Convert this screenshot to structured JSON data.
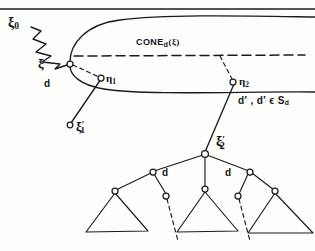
{
  "figure": {
    "ink_color": "#1a1b20",
    "paper_color": "#fdfdfc"
  },
  "labels": {
    "xi0": "ξ",
    "xi0_sub": "0",
    "xi": "ξ",
    "cone_word": "CONE",
    "cone_sub": "d",
    "cone_arg": "(ξ)",
    "d_left": "d",
    "eta1": "η",
    "eta1_sub": "1",
    "eta2": "η",
    "eta2_sub": "2",
    "xi_prime_1": "ξ",
    "xi_prime_1_sup": "′",
    "xi_prime_1_sub": "1",
    "xi_prime_2": "ξ",
    "xi_prime_2_sup": "′",
    "xi_prime_2_sub": "2",
    "d_set_condition": "d′ , d′ ϵ S",
    "d_set_condition_sub": "d",
    "d_tree_left": "d",
    "d_tree_right": "d"
  },
  "geometry": {
    "frame": {
      "top_rule_y": 9,
      "width": 315,
      "height": 251
    },
    "cone_apex": {
      "x": 70,
      "y": 64
    },
    "cone_upper_edge": "from apex curving up-right to the right edge at y=17",
    "cone_lower_edge": "from apex curving down-right to the right edge at y=92",
    "cone_axis_dashed": {
      "y": 56,
      "from_x": 74,
      "to_x": 305
    },
    "zigzag": {
      "from": [
        30,
        26
      ],
      "to": [
        70,
        62
      ],
      "teeth": 5
    },
    "nodes": [
      {
        "name": "xi",
        "x": 70,
        "y": 64,
        "r": 3
      },
      {
        "name": "eta1",
        "x": 101,
        "y": 78,
        "r": 3
      },
      {
        "name": "eta2",
        "x": 233,
        "y": 82,
        "r": 3
      },
      {
        "name": "xi-prime-1",
        "x": 70,
        "y": 125,
        "r": 3
      },
      {
        "name": "xi-prime-2",
        "x": 205,
        "y": 154,
        "r": 3.5
      },
      {
        "name": "tree-left-child",
        "x": 153,
        "y": 172,
        "r": 3
      },
      {
        "name": "tree-right-child",
        "x": 250,
        "y": 172,
        "r": 3
      },
      {
        "name": "leaf-a-root",
        "x": 115,
        "y": 192,
        "r": 3
      },
      {
        "name": "leaf-b-root",
        "x": 166,
        "y": 196,
        "r": 3
      },
      {
        "name": "leaf-c-root",
        "x": 205,
        "y": 190,
        "r": 3
      },
      {
        "name": "leaf-d-root",
        "x": 238,
        "y": 196,
        "r": 3
      },
      {
        "name": "leaf-e-root",
        "x": 275,
        "y": 192,
        "r": 3
      }
    ],
    "triangles": [
      {
        "name": "triangle-left",
        "apex": [
          115,
          192
        ],
        "left": [
          86,
          232
        ],
        "right": [
          148,
          231
        ]
      },
      {
        "name": "triangle-middle",
        "apex": [
          205,
          190
        ],
        "left": [
          177,
          232
        ],
        "right": [
          238,
          231
        ]
      },
      {
        "name": "triangle-right",
        "apex": [
          275,
          192
        ],
        "left": [
          248,
          233
        ],
        "right": [
          310,
          233
        ]
      }
    ],
    "dashed_droppers": [
      {
        "name": "dropper-left",
        "from": [
          166,
          196
        ],
        "to": [
          176,
          240
        ]
      },
      {
        "name": "dropper-right",
        "from": [
          238,
          196
        ],
        "to": [
          248,
          240
        ]
      }
    ]
  }
}
